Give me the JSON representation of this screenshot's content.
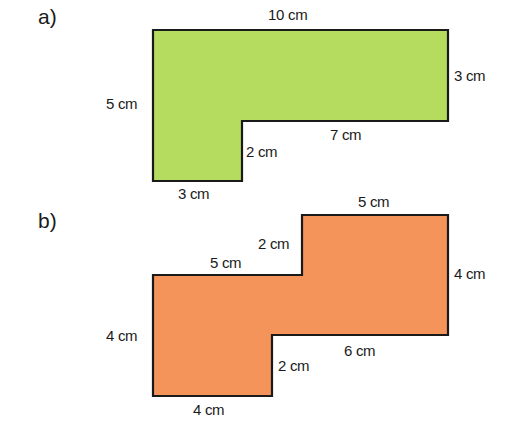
{
  "figures": [
    {
      "id": "a",
      "label": "a)",
      "label_pos": [
        38,
        6
      ],
      "fill": "#b5dc5e",
      "stroke": "#1a1a1a",
      "outline": [
        [
          153,
          30
        ],
        [
          448,
          30
        ],
        [
          448,
          121
        ],
        [
          242,
          121
        ],
        [
          242,
          181
        ],
        [
          153,
          181
        ]
      ],
      "dimensions": [
        {
          "text": "10 cm",
          "x": 268,
          "y": 7
        },
        {
          "text": "3 cm",
          "x": 454,
          "y": 68
        },
        {
          "text": "5 cm",
          "x": 106,
          "y": 96
        },
        {
          "text": "7 cm",
          "x": 330,
          "y": 127
        },
        {
          "text": "2 cm",
          "x": 246,
          "y": 144
        },
        {
          "text": "3 cm",
          "x": 178,
          "y": 186
        }
      ]
    },
    {
      "id": "b",
      "label": "b)",
      "label_pos": [
        38,
        210
      ],
      "fill": "#f4945a",
      "stroke": "#1a1a1a",
      "outline": [
        [
          153,
          275
        ],
        [
          302,
          275
        ],
        [
          302,
          215
        ],
        [
          448,
          215
        ],
        [
          448,
          335
        ],
        [
          272,
          335
        ],
        [
          272,
          396
        ],
        [
          153,
          396
        ]
      ],
      "dimensions": [
        {
          "text": "5 cm",
          "x": 358,
          "y": 194
        },
        {
          "text": "2 cm",
          "x": 258,
          "y": 236
        },
        {
          "text": "5 cm",
          "x": 210,
          "y": 255
        },
        {
          "text": "4 cm",
          "x": 454,
          "y": 266
        },
        {
          "text": "4 cm",
          "x": 106,
          "y": 328
        },
        {
          "text": "6 cm",
          "x": 344,
          "y": 343
        },
        {
          "text": "2 cm",
          "x": 278,
          "y": 358
        },
        {
          "text": "4 cm",
          "x": 193,
          "y": 402
        }
      ]
    }
  ]
}
